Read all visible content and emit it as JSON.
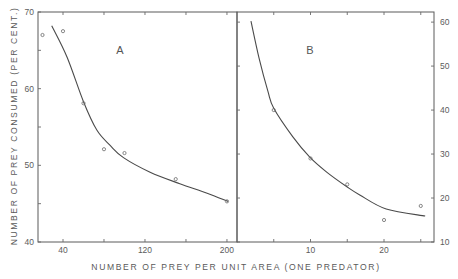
{
  "chart_data": {
    "type": "scatter",
    "title": "",
    "xlabel": "NUMBER OF PREY PER UNIT AREA (ONE PREDATOR)",
    "ylabel": "NUMBER OF PREY CONSUMED (PER CENT.)",
    "grid": false,
    "legend": null,
    "panels": [
      {
        "label": "A",
        "xlim": [
          15.6,
          209.8
        ],
        "ylim": [
          40,
          70
        ],
        "x_ticks": [
          40,
          80,
          120,
          160,
          200
        ],
        "x_tick_labels": [
          "40",
          "",
          "120",
          "",
          "200"
        ],
        "y_ticks": [
          40,
          45,
          50,
          55,
          60,
          65,
          70
        ],
        "y_tick_labels": [
          "40",
          "",
          "50",
          "",
          "60",
          "",
          "70"
        ],
        "y_axis_side": "left",
        "points": [
          {
            "x": 20,
            "y": 67.0
          },
          {
            "x": 40,
            "y": 67.5
          },
          {
            "x": 60,
            "y": 58.1
          },
          {
            "x": 80,
            "y": 52.1
          },
          {
            "x": 100,
            "y": 51.6
          },
          {
            "x": 150,
            "y": 48.2
          },
          {
            "x": 200,
            "y": 45.3
          }
        ],
        "fitted_curve": [
          [
            29,
            68.2
          ],
          [
            44,
            64.1
          ],
          [
            60,
            58.3
          ],
          [
            73,
            54.6
          ],
          [
            86,
            52.6
          ],
          [
            99,
            51.0
          ],
          [
            125,
            49.1
          ],
          [
            154,
            47.6
          ],
          [
            180,
            46.4
          ],
          [
            201,
            45.3
          ]
        ]
      },
      {
        "label": "B",
        "xlim": [
          0,
          26.8
        ],
        "ylim": [
          10,
          62.3
        ],
        "x_ticks": [
          5,
          10,
          15,
          20,
          25
        ],
        "x_tick_labels": [
          "",
          "10",
          "",
          "20",
          ""
        ],
        "y_ticks": [
          10,
          20,
          30,
          40,
          50,
          60
        ],
        "y_tick_labels": [
          "10",
          "20",
          "30",
          "40",
          "50",
          "60"
        ],
        "y_axis_side": "right",
        "points": [
          {
            "x": 5,
            "y": 40.0
          },
          {
            "x": 10,
            "y": 29.0
          },
          {
            "x": 15,
            "y": 23.1
          },
          {
            "x": 20,
            "y": 15.0
          },
          {
            "x": 25,
            "y": 18.2
          }
        ],
        "fitted_curve": [
          [
            1.9,
            60.2
          ],
          [
            3.0,
            51.8
          ],
          [
            4.2,
            44.3
          ],
          [
            5.0,
            40.4
          ],
          [
            7.6,
            33.9
          ],
          [
            9.9,
            29.3
          ],
          [
            12.2,
            25.9
          ],
          [
            15.0,
            22.5
          ],
          [
            16.7,
            20.7
          ],
          [
            20.3,
            17.5
          ],
          [
            25.6,
            15.9
          ]
        ]
      }
    ]
  }
}
